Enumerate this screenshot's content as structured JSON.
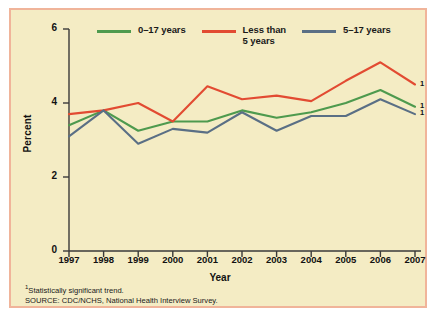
{
  "chart_data": {
    "type": "line",
    "title": "",
    "xlabel": "Year",
    "ylabel": "Percent",
    "categories": [
      "1997",
      "1998",
      "1999",
      "2000",
      "2001",
      "2002",
      "2003",
      "2004",
      "2005",
      "2006",
      "2007"
    ],
    "xlim": [
      1997,
      2007
    ],
    "ylim": [
      0,
      6
    ],
    "yticks": [
      0,
      2,
      4,
      6
    ],
    "grid": false,
    "legend_position": "top",
    "series": [
      {
        "name": "0–17 years",
        "color": "#4e9a4e",
        "values": [
          3.4,
          3.8,
          3.25,
          3.5,
          3.5,
          3.8,
          3.6,
          3.75,
          4.0,
          4.35,
          3.9
        ],
        "endpoint_marker": "1"
      },
      {
        "name": "Less than\n5 years",
        "color": "#e24b32",
        "values": [
          3.7,
          3.8,
          4.0,
          3.5,
          4.45,
          4.1,
          4.2,
          4.05,
          4.6,
          5.1,
          4.5
        ],
        "endpoint_marker": "1"
      },
      {
        "name": "5–17 years",
        "color": "#5a6f85",
        "values": [
          3.1,
          3.8,
          2.9,
          3.3,
          3.2,
          3.75,
          3.25,
          3.65,
          3.65,
          4.1,
          3.7
        ],
        "endpoint_marker": "1"
      }
    ]
  },
  "footnotes": {
    "significance": "Statistically significant trend.",
    "significance_marker": "1",
    "source": "SOURCE: CDC/NCHS, National Health Interview Survey."
  },
  "colors": {
    "background": "#f4ecc4",
    "border": "#f0b49a",
    "axis": "#3a3a3a",
    "text": "#1a1a1a"
  }
}
